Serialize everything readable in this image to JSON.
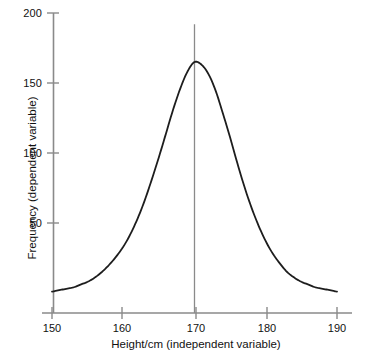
{
  "chart_data": {
    "type": "line",
    "title": "",
    "subtitle": "",
    "xlabel": "Height/cm (independent variable)",
    "ylabel": "Frequency (dependent variable)",
    "xlim": [
      149,
      191
    ],
    "ylim": [
      0,
      205
    ],
    "xticks": [
      150,
      160,
      170,
      180,
      190
    ],
    "xtick_labels": [
      "150",
      "160",
      "170",
      "180",
      "190"
    ],
    "yticks": [
      50,
      100,
      150,
      200
    ],
    "ytick_labels": [
      "50",
      "100",
      "150",
      "200"
    ],
    "grid": false,
    "legend": null,
    "line_color": "#1d1d1d",
    "axis_color": "#8a8a8a",
    "annotation_line_color": "#8a8a8a",
    "annotations": [
      {
        "name": "mean-marker",
        "type": "vline",
        "x": 170,
        "y_from": 165,
        "y_to": 192,
        "label": ""
      }
    ],
    "series": [
      {
        "name": "Height frequency distribution",
        "x": [
          150,
          151,
          152,
          153,
          154,
          155,
          156,
          157,
          158,
          159,
          160,
          161,
          162,
          163,
          164,
          165,
          166,
          167,
          168,
          169,
          170,
          171,
          172,
          173,
          174,
          175,
          176,
          177,
          178,
          179,
          180,
          181,
          182,
          183,
          184,
          185,
          186,
          187,
          188,
          189,
          190
        ],
        "values": [
          1,
          2,
          3,
          4,
          6,
          8,
          11,
          15,
          20,
          26,
          33,
          42,
          53,
          66,
          81,
          97,
          114,
          131,
          146,
          158,
          165,
          163,
          156,
          144,
          128,
          111,
          93,
          76,
          61,
          48,
          37,
          28,
          21,
          15,
          11,
          8,
          6,
          4,
          3,
          2,
          1
        ]
      }
    ],
    "peak": {
      "x": 170,
      "y": 165
    }
  },
  "axes": {
    "x_title": "Height/cm (independent variable)",
    "y_title": "Frequency (dependent variable)"
  }
}
